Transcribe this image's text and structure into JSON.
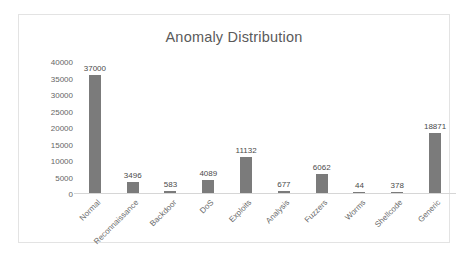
{
  "chart_data": {
    "type": "bar",
    "title": "Anomaly Distribution",
    "xlabel": "",
    "ylabel": "",
    "categories": [
      "Normal",
      "Reconnaissance",
      "Backdoor",
      "DoS",
      "Exploits",
      "Analysis",
      "Fuzzers",
      "Worms",
      "Shellcode",
      "Generic"
    ],
    "values": [
      37000,
      3496,
      583,
      4089,
      11132,
      677,
      6062,
      44,
      378,
      18871
    ],
    "data_labels": [
      "37000",
      "3496",
      "583",
      "4089",
      "11132",
      "677",
      "6062",
      "44",
      "378",
      "18871"
    ],
    "ylim": [
      0,
      40000
    ],
    "ytick_values": [
      0,
      5000,
      10000,
      15000,
      20000,
      25000,
      30000,
      35000,
      40000
    ],
    "ytick_labels": [
      "0",
      "5000",
      "10000",
      "15000",
      "20000",
      "25000",
      "30000",
      "35000",
      "40000"
    ],
    "grid": false,
    "legend": false,
    "legend_position": "none",
    "series_name": "Anomaly Distribution",
    "bar_color": "#7b7b7b",
    "title_color": "#5a5a5a",
    "axis_text_color": "#666666",
    "frame_color": "#e3e3e3",
    "baseline_color": "#d6d6d6",
    "xtick_rotation": -45,
    "background_color": "#ffffff"
  }
}
